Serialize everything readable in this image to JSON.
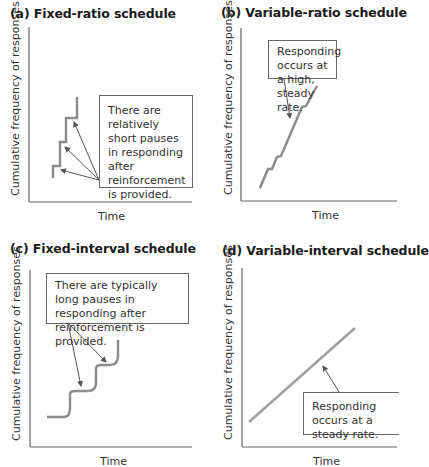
{
  "panels": [
    {
      "id": "a",
      "title": "(a) Fixed-ratio schedule",
      "ylabel": "Cumulative frequency of responses",
      "xlabel": "Time",
      "callout": "There are relatively short pauses in responding after reinforcement is provided."
    },
    {
      "id": "b",
      "title": "(b) Variable-ratio schedule",
      "ylabel": "Cumulative frequency of responses",
      "xlabel": "Time",
      "callout": "Responding occurs at a high, steady rate."
    },
    {
      "id": "c",
      "title": "(c) Fixed-interval schedule",
      "ylabel": "Cumulative frequency of responses",
      "xlabel": "Time",
      "callout": "There are typically long pauses in responding after reinforcement is provided."
    },
    {
      "id": "d",
      "title": "(d) Variable-interval schedule",
      "ylabel": "Cumulative frequency of responses",
      "xlabel": "Time",
      "callout": "Responding occurs at a steady rate."
    }
  ],
  "colors": {
    "axis": "#555555",
    "curve": "#8c8c8c",
    "arrow": "#555555",
    "callout_border": "#666666"
  }
}
